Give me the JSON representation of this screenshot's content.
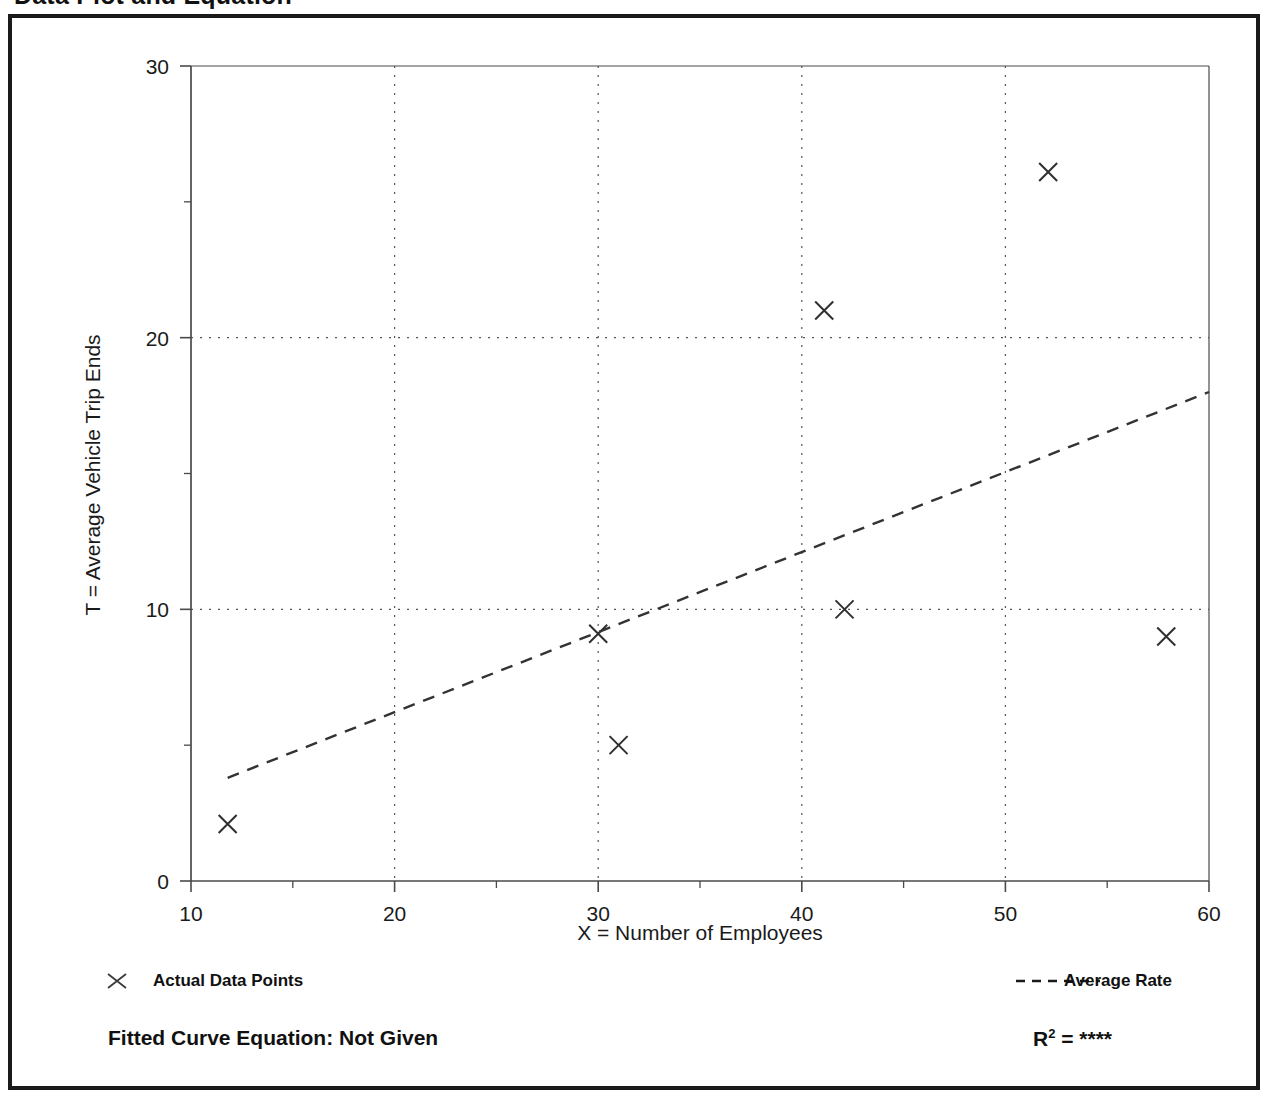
{
  "page": {
    "title": "Data Plot and Equation"
  },
  "legend": {
    "data_points": {
      "label": "Actual Data Points",
      "marker": "x-marker-icon"
    },
    "average_rate": {
      "label": "Average Rate",
      "marker": "dashed-line-icon"
    }
  },
  "footer": {
    "fitted_equation_label": "Fitted Curve Equation:  Not Given",
    "r_squared_symbol": "R",
    "r_squared_exponent": "2",
    "r_squared_equals": " = ",
    "r_squared_value": "****"
  },
  "chart_data": {
    "type": "scatter",
    "title": "Data Plot and Equation",
    "xlabel": "X = Number of Employees",
    "ylabel": "T = Average Vehicle Trip Ends",
    "xlim": [
      10,
      60
    ],
    "ylim": [
      0,
      30
    ],
    "xticks": [
      10,
      20,
      30,
      40,
      50,
      60
    ],
    "xtick_labels": [
      "10",
      "20",
      "30",
      "40",
      "50",
      "60"
    ],
    "xminorticks": [
      15,
      25,
      35,
      45,
      55
    ],
    "yticks": [
      0,
      10,
      20,
      30
    ],
    "ytick_labels": [
      "0",
      "10",
      "20",
      "30"
    ],
    "yminorticks": [
      5,
      15,
      25
    ],
    "grid": "dotted gridlines at major x and y ticks",
    "legend_position": "below-axes",
    "series": [
      {
        "name": "Actual Data Points",
        "type": "scatter",
        "marker": "x",
        "points": [
          {
            "x": 11.8,
            "y": 2.1
          },
          {
            "x": 30.0,
            "y": 9.1
          },
          {
            "x": 31.0,
            "y": 5.0
          },
          {
            "x": 41.1,
            "y": 21.0
          },
          {
            "x": 42.1,
            "y": 10.0
          },
          {
            "x": 52.1,
            "y": 26.1
          },
          {
            "x": 57.9,
            "y": 9.0
          }
        ]
      },
      {
        "name": "Average Rate",
        "type": "line",
        "style": "dashed",
        "points": [
          {
            "x": 11.8,
            "y": 3.8
          },
          {
            "x": 60.0,
            "y": 18.0
          }
        ]
      }
    ]
  }
}
